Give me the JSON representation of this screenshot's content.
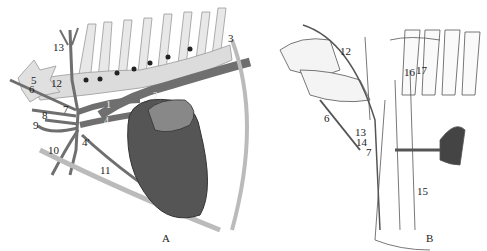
{
  "figure": {
    "panels": [
      {
        "id": "A",
        "caption": "A",
        "labels": [
          "13",
          "3",
          "5",
          "6",
          "12",
          "2",
          "1",
          "7",
          "8",
          "9",
          "4",
          "4'",
          "10",
          "11"
        ]
      },
      {
        "id": "B",
        "caption": "B",
        "labels": [
          "12",
          "16",
          "17",
          "6",
          "13",
          "14",
          "7",
          "15"
        ]
      }
    ]
  },
  "colors": {
    "vessel": "#6f6f6f",
    "bone": "#e4e4e4",
    "heart": "#555555",
    "outline": "#777777"
  }
}
